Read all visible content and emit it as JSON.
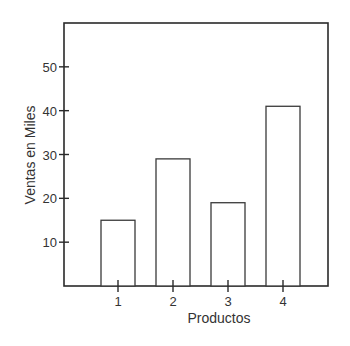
{
  "chart_data": {
    "type": "bar",
    "title": "",
    "xlabel": "Productos",
    "ylabel": "Ventas en Miles",
    "categories": [
      "1",
      "2",
      "3",
      "4"
    ],
    "values": [
      15,
      29,
      19,
      41
    ],
    "yticks": [
      10,
      20,
      30,
      40,
      50
    ],
    "ylim": [
      0,
      60
    ],
    "grid": false,
    "legend": null
  },
  "colors": {
    "axis": "#2a2a2a",
    "bar_stroke": "#3a3a3a",
    "bar_fill": "#ffffff"
  }
}
